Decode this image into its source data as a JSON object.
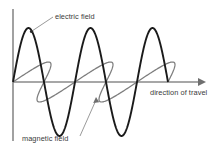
{
  "figure": {
    "background_color": "#ffffff"
  },
  "axes": {
    "vertical_axis": {
      "name": "amplitude-axis",
      "color": "#8a8a8a",
      "x": 13,
      "y_top": 9,
      "y_bottom": 141
    },
    "horizontal_axis": {
      "name": "propagation-axis",
      "color": "#8a8a8a",
      "y": 82,
      "x_start": 13,
      "x_end": 202,
      "arrowhead": true
    }
  },
  "labels": {
    "electric": "electric field",
    "magnetic": "magnetic field",
    "direction": "direction of travel"
  },
  "colors": {
    "electric_wave": "#1a1a1a",
    "magnetic_wave": "#7d7d7d",
    "axis": "#8a8a8a",
    "leader_line": "#9a9a9a",
    "text": "#3a3a3a"
  },
  "chart_data": {
    "type": "line",
    "xlabel": "direction of travel",
    "ylabel": "",
    "grid": false,
    "legend": "annotations",
    "axis_origin": [
      13,
      82
    ],
    "baseline_y": 82,
    "series": [
      {
        "name": "electric field",
        "color": "#1a1a1a",
        "plane": "vertical",
        "amplitude_px": 54,
        "wavelength_px": 62,
        "phase": 0,
        "cycles": 3,
        "x_start": 13,
        "x_end": 168,
        "crests_x": [
          27,
          89,
          151
        ],
        "troughs_x": [
          58,
          120
        ],
        "zero_crossings_x": [
          13,
          44,
          75,
          106,
          137,
          168
        ]
      },
      {
        "name": "magnetic field",
        "color": "#7d7d7d",
        "plane": "horizontal-perspective",
        "amplitude_px": 20,
        "wavelength_px": 62,
        "phase": 0,
        "cycles": 3,
        "x_start": 13,
        "x_end": 168,
        "skew_dx_px": 20,
        "zero_crossings_x": [
          13,
          44,
          75,
          106,
          137,
          168
        ]
      }
    ],
    "annotations": [
      {
        "text": "electric field",
        "text_x": 55,
        "text_y": 19,
        "leader_from": [
          53,
          17
        ],
        "leader_to": [
          31,
          32
        ]
      },
      {
        "text": "magnetic field",
        "text_x": 22,
        "text_y": 141,
        "leader_from": [
          79,
          138
        ],
        "leader_to": [
          96,
          98
        ]
      },
      {
        "text": "direction of travel",
        "text_x": 150,
        "text_y": 95,
        "leader_from": null,
        "leader_to": null
      }
    ]
  }
}
